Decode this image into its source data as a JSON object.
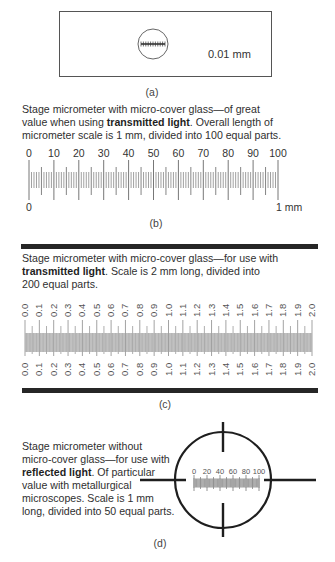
{
  "panel_a": {
    "caption": "(a)",
    "scale_label": "0.01 mm"
  },
  "panel_b": {
    "description": {
      "line1": "Stage micrometer with micro-cover glass—of great",
      "line2_pre": "value when using ",
      "line2_bold": "transmitted light",
      "line2_post": ". Overall length of",
      "line3": "micrometer scale is 1 mm, divided into 100 equal parts."
    },
    "top_labels": [
      "0",
      "10",
      "20",
      "30",
      "40",
      "50",
      "60",
      "70",
      "80",
      "90",
      "100"
    ],
    "bottom_left_label": "0",
    "bottom_right_label": "1 mm",
    "divisions": 100,
    "caption": "(b)"
  },
  "panel_c": {
    "description": {
      "line1": "Stage micrometer with micro-cover glass—for use with",
      "line2_bold": "transmitted light",
      "line2_post": ". Scale is 2 mm long, divided into",
      "line3": "200 equal parts."
    },
    "labels": [
      "0.0",
      "0.1",
      "0.2",
      "0.3",
      "0.4",
      "0.5",
      "0.6",
      "0.7",
      "0.8",
      "0.9",
      "1.0",
      "1.1",
      "1.2",
      "1.3",
      "1.4",
      "1.5",
      "1.6",
      "1.7",
      "1.8",
      "1.9",
      "2.0"
    ],
    "divisions": 200,
    "caption": "(c)"
  },
  "panel_d": {
    "description": {
      "line1": "Stage micrometer without",
      "line2": "micro-cover glass—for use with",
      "line3_bold": "reflected light",
      "line3_post": ". Of particular",
      "line4": "value with metallurgical",
      "line5": "microscopes. Scale is 1 mm",
      "line6": "long, divided into 50 equal parts."
    },
    "scale_labels": [
      "0",
      "20",
      "40",
      "60",
      "80",
      "100"
    ],
    "divisions": 50,
    "caption": "(d)"
  }
}
